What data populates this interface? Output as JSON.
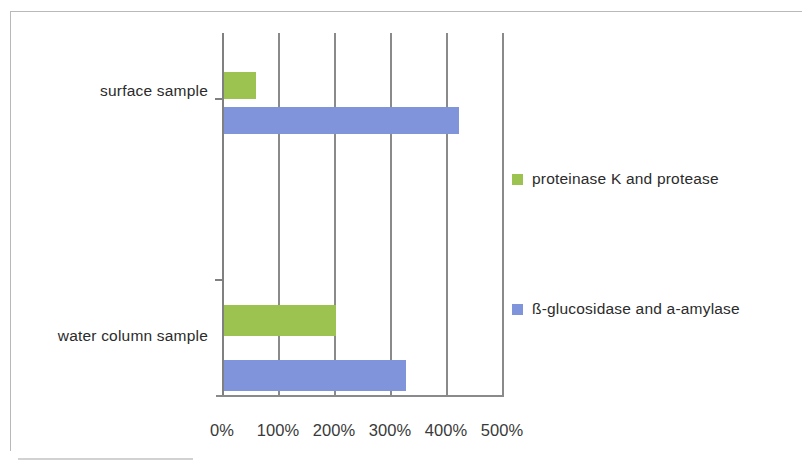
{
  "chart_data": {
    "type": "bar",
    "orientation": "horizontal",
    "title": "",
    "xlabel": "",
    "ylabel": "",
    "categories": [
      "surface sample",
      "water column sample"
    ],
    "series": [
      {
        "name": "proteinase K and  protease",
        "color": "#9cc250",
        "values": [
          57,
          200
        ]
      },
      {
        "name": "ß-glucosidase and a-amylase",
        "color": "#8094db",
        "values": [
          420,
          325
        ]
      }
    ],
    "xlim": [
      0,
      500
    ],
    "xticks": [
      0,
      100,
      200,
      300,
      400,
      500
    ],
    "xtick_labels": [
      "0%",
      "100%",
      "200%",
      "300%",
      "400%",
      "500%"
    ],
    "grid": {
      "vertical": true,
      "horizontal": false,
      "color": "#8a8a8a"
    },
    "legend": {
      "position": "right",
      "entries": [
        "proteinase K and  protease",
        "ß-glucosidase and a-amylase"
      ]
    },
    "axis_color": "#808080",
    "background": "#ffffff"
  }
}
